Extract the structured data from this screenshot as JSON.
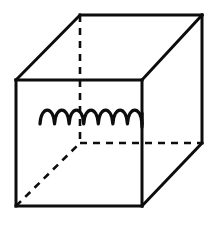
{
  "figure": {
    "background_color": "#ffffff",
    "line_color": "#0d0d0d",
    "canvas": {
      "width": 216,
      "height": 228
    }
  },
  "geometry": {
    "projection": "oblique",
    "front_face": {
      "name": "front-face",
      "top_left": [
        16,
        80
      ],
      "top_right": [
        142,
        80
      ],
      "bottom_right": [
        142,
        206
      ],
      "bottom_left": [
        16,
        206
      ],
      "side_length_px": 126
    },
    "back_face": {
      "name": "back-face",
      "top_left": [
        80,
        15
      ],
      "top_right": [
        202,
        15
      ],
      "bottom_right": [
        202,
        143
      ],
      "bottom_left": [
        80,
        143
      ],
      "side_length_px": 122
    },
    "depth_offset": [
      64,
      -65
    ],
    "visible_edges": [
      {
        "name": "front-top-edge",
        "from": [
          16,
          80
        ],
        "to": [
          142,
          80
        ]
      },
      {
        "name": "front-right-edge",
        "from": [
          142,
          80
        ],
        "to": [
          142,
          206
        ]
      },
      {
        "name": "front-bottom-edge",
        "from": [
          142,
          206
        ],
        "to": [
          16,
          206
        ]
      },
      {
        "name": "front-left-edge",
        "from": [
          16,
          206
        ],
        "to": [
          16,
          80
        ]
      },
      {
        "name": "back-top-edge",
        "from": [
          80,
          15
        ],
        "to": [
          202,
          15
        ]
      },
      {
        "name": "back-right-edge",
        "from": [
          202,
          15
        ],
        "to": [
          202,
          143
        ]
      },
      {
        "name": "connector-top-left",
        "from": [
          16,
          80
        ],
        "to": [
          80,
          15
        ]
      },
      {
        "name": "connector-top-right",
        "from": [
          142,
          80
        ],
        "to": [
          202,
          15
        ]
      },
      {
        "name": "connector-bottom-right",
        "from": [
          142,
          206
        ],
        "to": [
          202,
          143
        ]
      }
    ],
    "hidden_edges": [
      {
        "name": "back-left-vertical-edge",
        "from": [
          80,
          15
        ],
        "to": [
          80,
          143
        ]
      },
      {
        "name": "back-bottom-edge",
        "from": [
          80,
          143
        ],
        "to": [
          202,
          143
        ]
      },
      {
        "name": "connector-bottom-left",
        "from": [
          16,
          206
        ],
        "to": [
          80,
          143
        ]
      }
    ]
  },
  "coil": {
    "name": "helical-coil",
    "loop_count": 7,
    "start_point": [
      40,
      124
    ],
    "end_point": [
      142,
      124
    ],
    "baseline_y": 124,
    "arc_width_px": 14.6,
    "arc_height_px": 12,
    "right_tail": {
      "from": [
        142,
        112
      ],
      "to": [
        142,
        128
      ]
    },
    "orientation": "horizontal",
    "stroke_width": 3.2
  },
  "labels": {
    "visible_text": []
  }
}
